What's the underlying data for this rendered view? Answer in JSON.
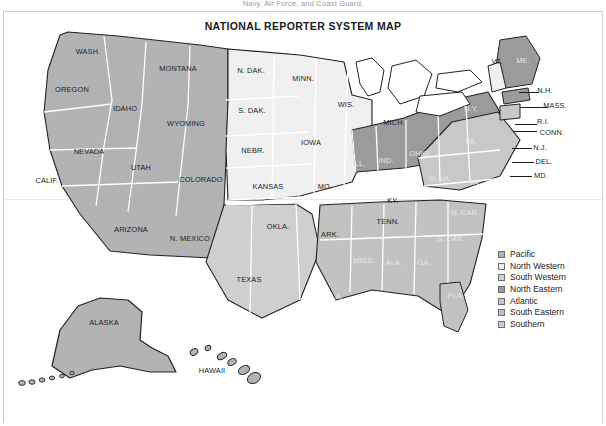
{
  "document": {
    "top_caption": "Navy, Air Force, and Coast Guard.",
    "title": "NATIONAL REPORTER SYSTEM MAP"
  },
  "legend": {
    "items": [
      {
        "label": "Pacific",
        "swatch": "#b3b3b3"
      },
      {
        "label": "North Western",
        "swatch": "#efefef"
      },
      {
        "label": "South Western",
        "swatch": "#d2d2d2"
      },
      {
        "label": "North Eastern",
        "swatch": "#9a9a9a"
      },
      {
        "label": "Atlantic",
        "swatch": "#c6c6c6"
      },
      {
        "label": "South Eastern",
        "swatch": "#c0c0c0"
      },
      {
        "label": "Southern",
        "swatch": "#cfcfcf"
      }
    ]
  },
  "colors": {
    "pacific": "#b3b3b3",
    "north_western": "#f0f0f0",
    "south_western": "#cfcfcf",
    "north_eastern": "#9b9b9b",
    "atlantic": "#c8c8c8",
    "south_eastern": "#c2c2c2",
    "southern": "#cbcbcb",
    "stroke_internal": "#ffffff",
    "stroke_outline": "#222222",
    "page_background": "#ffffff"
  },
  "map": {
    "states": [
      {
        "name": "WASH.",
        "x": 88,
        "y": 51,
        "region": "pacific",
        "tone": "dark"
      },
      {
        "name": "OREGON",
        "x": 72,
        "y": 89,
        "region": "pacific",
        "tone": "dark"
      },
      {
        "name": "IDAHO",
        "x": 125,
        "y": 108,
        "region": "pacific",
        "tone": "dark"
      },
      {
        "name": "MONTANA",
        "x": 178,
        "y": 68,
        "region": "pacific",
        "tone": "dark"
      },
      {
        "name": "WYOMING",
        "x": 186,
        "y": 123,
        "region": "pacific",
        "tone": "dark"
      },
      {
        "name": "NEVADA",
        "x": 89,
        "y": 151,
        "region": "pacific",
        "tone": "dark"
      },
      {
        "name": "UTAH",
        "x": 141,
        "y": 167,
        "region": "pacific",
        "tone": "dark"
      },
      {
        "name": "CALIF.",
        "x": 47,
        "y": 180,
        "region": "pacific",
        "tone": "dark"
      },
      {
        "name": "COLORADO",
        "x": 201,
        "y": 179,
        "region": "pacific",
        "tone": "dark"
      },
      {
        "name": "ARIZONA",
        "x": 131,
        "y": 229,
        "region": "pacific",
        "tone": "dark"
      },
      {
        "name": "N. MEXICO",
        "x": 190,
        "y": 238,
        "region": "pacific",
        "tone": "dark"
      },
      {
        "name": "ALASKA",
        "x": 104,
        "y": 322,
        "region": "pacific",
        "tone": "dark"
      },
      {
        "name": "HAWAII",
        "x": 212,
        "y": 370,
        "region": "pacific",
        "tone": "dark"
      },
      {
        "name": "N. DAK.",
        "x": 251,
        "y": 70,
        "region": "north_western",
        "tone": "dark"
      },
      {
        "name": "S. DAK.",
        "x": 252,
        "y": 110,
        "region": "north_western",
        "tone": "dark"
      },
      {
        "name": "NEBR.",
        "x": 253,
        "y": 150,
        "region": "north_western",
        "tone": "dark"
      },
      {
        "name": "KANSAS",
        "x": 268,
        "y": 186,
        "region": "north_western",
        "tone": "dark"
      },
      {
        "name": "MINN.",
        "x": 303,
        "y": 78,
        "region": "north_western",
        "tone": "dark"
      },
      {
        "name": "IOWA",
        "x": 311,
        "y": 142,
        "region": "north_western",
        "tone": "dark"
      },
      {
        "name": "MO.",
        "x": 325,
        "y": 186,
        "region": "north_western",
        "tone": "dark"
      },
      {
        "name": "WIS.",
        "x": 346,
        "y": 104,
        "region": "north_western",
        "tone": "dark"
      },
      {
        "name": "MICH.",
        "x": 394,
        "y": 122,
        "region": "north_western",
        "tone": "dark"
      },
      {
        "name": "ARK.",
        "x": 330,
        "y": 234,
        "region": "north_western",
        "tone": "dark"
      },
      {
        "name": "KY.",
        "x": 393,
        "y": 200,
        "region": "north_western",
        "tone": "dark"
      },
      {
        "name": "TENN.",
        "x": 388,
        "y": 221,
        "region": "north_western",
        "tone": "dark"
      },
      {
        "name": "OKLA.",
        "x": 278,
        "y": 226,
        "region": "south_western",
        "tone": "dark"
      },
      {
        "name": "TEXAS",
        "x": 249,
        "y": 279,
        "region": "south_western",
        "tone": "dark"
      },
      {
        "name": "ILL.",
        "x": 359,
        "y": 163,
        "region": "north_eastern",
        "tone": "light"
      },
      {
        "name": "IND.",
        "x": 386,
        "y": 160,
        "region": "north_eastern",
        "tone": "light"
      },
      {
        "name": "OHIO",
        "x": 419,
        "y": 153,
        "region": "north_eastern",
        "tone": "light"
      },
      {
        "name": "N.Y.",
        "x": 471,
        "y": 108,
        "region": "north_eastern",
        "tone": "light"
      },
      {
        "name": "ME.",
        "x": 523,
        "y": 60,
        "region": "north_eastern",
        "tone": "light"
      },
      {
        "name": "PA",
        "x": 470,
        "y": 141,
        "region": "atlantic",
        "tone": "light"
      },
      {
        "name": "W. VA.",
        "x": 440,
        "y": 178,
        "region": "atlantic",
        "tone": "light"
      },
      {
        "name": "VA.",
        "x": 475,
        "y": 182,
        "region": "atlantic",
        "tone": "light"
      },
      {
        "name": "N. CAR.",
        "x": 465,
        "y": 212,
        "region": "south_eastern",
        "tone": "light"
      },
      {
        "name": "S. CAR.",
        "x": 451,
        "y": 238,
        "region": "south_eastern",
        "tone": "light"
      },
      {
        "name": "GA.",
        "x": 424,
        "y": 262,
        "region": "south_eastern",
        "tone": "light"
      },
      {
        "name": "ALA.",
        "x": 394,
        "y": 262,
        "region": "south_eastern",
        "tone": "light"
      },
      {
        "name": "MISS.",
        "x": 364,
        "y": 260,
        "region": "south_eastern",
        "tone": "light"
      },
      {
        "name": "FLA.",
        "x": 456,
        "y": 295,
        "region": "south_eastern",
        "tone": "light"
      },
      {
        "name": "LA.",
        "x": 337,
        "y": 296,
        "region": "southern",
        "tone": "light"
      },
      {
        "name": "VT.",
        "x": 497,
        "y": 61,
        "region": "north_eastern",
        "tone": "dark"
      }
    ],
    "callouts": [
      {
        "name": "N.H.",
        "x": 545,
        "y": 90,
        "line_x": 519,
        "line_y": 92,
        "line_w": 20
      },
      {
        "name": "MASS.",
        "x": 555,
        "y": 105,
        "line_x": 520,
        "line_y": 107,
        "line_w": 28
      },
      {
        "name": "R.I.",
        "x": 543,
        "y": 121,
        "line_x": 515,
        "line_y": 124,
        "line_w": 22
      },
      {
        "name": "CONN.",
        "x": 552,
        "y": 132,
        "line_x": 513,
        "line_y": 131,
        "line_w": 24
      },
      {
        "name": "N.J.",
        "x": 540,
        "y": 147,
        "line_x": 512,
        "line_y": 148,
        "line_w": 20
      },
      {
        "name": "DEL.",
        "x": 544,
        "y": 161,
        "line_x": 512,
        "line_y": 162,
        "line_w": 22
      },
      {
        "name": "MD.",
        "x": 541,
        "y": 175,
        "line_x": 510,
        "line_y": 176,
        "line_w": 22
      }
    ]
  }
}
